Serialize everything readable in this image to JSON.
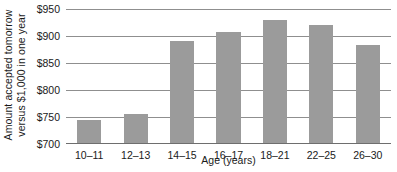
{
  "chart_data": {
    "type": "bar",
    "title": "",
    "subtitle": "",
    "categories": [
      "10–11",
      "12–13",
      "14–15",
      "16–17",
      "18–21",
      "22–25",
      "26–30"
    ],
    "values": [
      742,
      753,
      888,
      906,
      927,
      918,
      882
    ],
    "xlabel": "Age (years)",
    "ylabel_line1": "Amount accepted tomorrow",
    "ylabel_line2": "versus $1,000 in one year",
    "ylabel": "Amount accepted tomorrow versus $1,000 in one year",
    "ylim": [
      700,
      950
    ],
    "yticks": [
      700,
      750,
      800,
      850,
      900,
      950
    ],
    "ytick_labels": [
      "$700",
      "$750",
      "$800",
      "$850",
      "$900",
      "$950"
    ],
    "grid": true,
    "grid_axis": "y",
    "legend": false,
    "legend_position": "none",
    "bar_color": "#9b9b9b",
    "grid_color": "#8f8f8f",
    "axis_color": "#6e6e6e",
    "text_color": "#1a1a1a",
    "background": "#ffffff"
  }
}
